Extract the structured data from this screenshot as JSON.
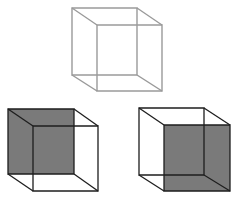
{
  "diagram": {
    "title": "",
    "background": "#ffffff",
    "cubes": [
      {
        "id": "top-neutral-cube",
        "label": "",
        "stroke": "#9a9a9a",
        "stroke_width": 1.4,
        "back": {
          "x": 72,
          "y": 8,
          "w": 65,
          "h": 67
        },
        "front": {
          "x": 97,
          "y": 25,
          "w": 65,
          "h": 66
        },
        "shaded_face": "none",
        "fill": "none"
      },
      {
        "id": "bottom-left-cube",
        "label": "",
        "stroke": "#1e1e1e",
        "stroke_width": 1.3,
        "back": {
          "x": 8,
          "y": 109,
          "w": 66,
          "h": 65
        },
        "front": {
          "x": 33,
          "y": 126,
          "w": 65,
          "h": 65
        },
        "shaded_face": "back",
        "fill": "#7a7a7a"
      },
      {
        "id": "bottom-right-cube",
        "label": "",
        "stroke": "#1e1e1e",
        "stroke_width": 1.3,
        "back": {
          "x": 139,
          "y": 108,
          "w": 65,
          "h": 67
        },
        "front": {
          "x": 164,
          "y": 125,
          "w": 66,
          "h": 66
        },
        "shaded_face": "front",
        "fill": "#7a7a7a"
      }
    ]
  }
}
